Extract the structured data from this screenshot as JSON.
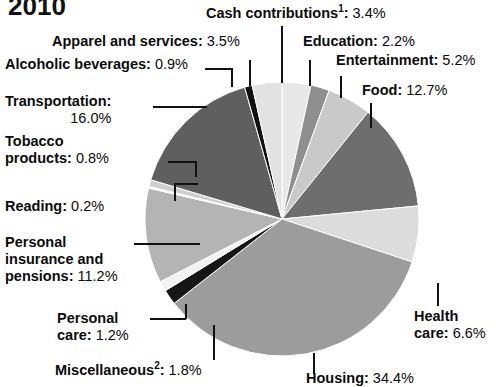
{
  "title": "2010",
  "chart_data": {
    "type": "pie",
    "title": "2010",
    "units": "percent",
    "legend_position": "callout-labels",
    "grid": false,
    "start_angle_deg": 0,
    "direction": "clockwise",
    "categories": [
      "Cash contributions¹",
      "Education",
      "Entertainment",
      "Food",
      "Health care",
      "Housing",
      "Miscellaneous²",
      "Personal care",
      "Personal insurance and pensions",
      "Reading",
      "Tobacco products",
      "Transportation",
      "Alcoholic beverages",
      "Apparel and services"
    ],
    "values": [
      3.4,
      2.2,
      5.2,
      12.7,
      6.6,
      34.4,
      1.8,
      1.2,
      11.2,
      0.2,
      0.8,
      16.0,
      0.9,
      3.5
    ],
    "slices": [
      {
        "label": "Cash contributions",
        "footnote": "1",
        "value": 3.4,
        "value_text": "3.4%",
        "fill": "#e8e8e8"
      },
      {
        "label": "Education",
        "footnote": "",
        "value": 2.2,
        "value_text": "2.2%",
        "fill": "#8f8f8f"
      },
      {
        "label": "Entertainment",
        "footnote": "",
        "value": 5.2,
        "value_text": "5.2%",
        "fill": "#c9c9c9"
      },
      {
        "label": "Food",
        "footnote": "",
        "value": 12.7,
        "value_text": "12.7%",
        "fill": "#6e6e6e"
      },
      {
        "label": "Health care",
        "footnote": "",
        "value": 6.6,
        "value_text": "6.6%",
        "fill": "#dcdcdc"
      },
      {
        "label": "Housing",
        "footnote": "",
        "value": 34.4,
        "value_text": "34.4%",
        "fill": "#9c9c9c"
      },
      {
        "label": "Miscellaneous",
        "footnote": "2",
        "value": 1.8,
        "value_text": "1.8%",
        "fill": "#161616"
      },
      {
        "label": "Personal care",
        "footnote": "",
        "value": 1.2,
        "value_text": "1.2%",
        "fill": "#f2f2f2"
      },
      {
        "label": "Personal insurance and pensions",
        "footnote": "",
        "value": 11.2,
        "value_text": "11.2%",
        "fill": "#b4b4b4"
      },
      {
        "label": "Reading",
        "footnote": "",
        "value": 0.2,
        "value_text": "0.2%",
        "fill": "#f4f4f4"
      },
      {
        "label": "Tobacco products",
        "footnote": "",
        "value": 0.8,
        "value_text": "0.8%",
        "fill": "#cfcfcf"
      },
      {
        "label": "Transportation",
        "footnote": "",
        "value": 16.0,
        "value_text": "16.0%",
        "fill": "#5f5f5f"
      },
      {
        "label": "Alcoholic beverages",
        "footnote": "",
        "value": 0.9,
        "value_text": "0.9%",
        "fill": "#111111"
      },
      {
        "label": "Apparel and services",
        "footnote": "",
        "value": 3.5,
        "value_text": "3.5%",
        "fill": "#e2e2e2"
      }
    ]
  },
  "labels": {
    "cash_contributions": {
      "name": "Cash contributions",
      "sup": "1",
      "sep": ": ",
      "value": "3.4%"
    },
    "apparel": {
      "name": "Apparel and services",
      "sep": ": ",
      "value": "3.5%"
    },
    "alcoholic": {
      "name": "Alcoholic beverages",
      "sep": ": ",
      "value": "0.9%"
    },
    "education": {
      "name": "Education",
      "sep": ": ",
      "value": "2.2%"
    },
    "entertainment": {
      "name": "Entertainment",
      "sep": ": ",
      "value": "5.2%"
    },
    "food": {
      "name": "Food",
      "sep": ": ",
      "value": "12.7%"
    },
    "transportation": {
      "name": "Transportation:",
      "value": "16.0%"
    },
    "tobacco": {
      "name_line1": "Tobacco",
      "name_line2": "products",
      "sep": ": ",
      "value": "0.8%"
    },
    "reading": {
      "name": "Reading",
      "sep": ": ",
      "value": "0.2%"
    },
    "personal_insurance": {
      "name_line1": "Personal",
      "name_line2": "insurance and",
      "name_line3": "pensions",
      "sep": ": ",
      "value": "11.2%"
    },
    "personal_care": {
      "name_line1": "Personal",
      "name_line2": "care",
      "sep": ": ",
      "value": "1.2%"
    },
    "miscellaneous": {
      "name": "Miscellaneous",
      "sup": "2",
      "sep": ": ",
      "value": "1.8%"
    },
    "health_care": {
      "name_line1": "Health",
      "name_line2": "care",
      "sep": ": ",
      "value": "6.6%"
    },
    "housing": {
      "name": "Housing",
      "sep": ": ",
      "value": "34.4%"
    }
  },
  "colors": {
    "text": "#0b0b0b",
    "leader": "#111111",
    "background": "#ffffff"
  }
}
